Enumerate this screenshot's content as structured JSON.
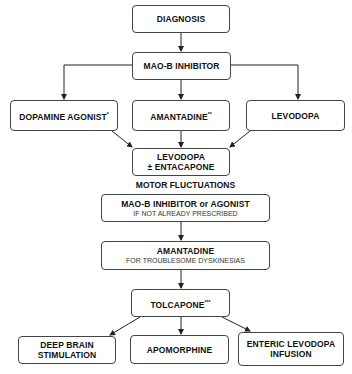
{
  "diagram": {
    "nodes": {
      "diagnosis": {
        "label": "DIAGNOSIS"
      },
      "maob": {
        "label": "MAO-B INHIBITOR"
      },
      "dopamine_agonist": {
        "label": "DOPAMINE AGONIST",
        "mark": "*"
      },
      "amantadine1": {
        "label": "AMANTADINE",
        "mark": "**"
      },
      "levodopa": {
        "label": "LEVODOPA"
      },
      "levodopa_entacapone": {
        "line1": "LEVODOPA",
        "line2": "± ENTACAPONE"
      },
      "maob_or_agonist": {
        "label": "MAO-B INHIBITOR or AGONIST",
        "sub": "IF NOT ALREADY PRESCRIBED"
      },
      "amantadine2": {
        "label": "AMANTADINE",
        "sub": "FOR TROUBLESOME DYSKINESIAS"
      },
      "tolcapone": {
        "label": "TOLCAPONE",
        "mark": "***"
      },
      "dbs": {
        "line1": "DEEP BRAIN",
        "line2": "STIMULATION"
      },
      "apomorphine": {
        "label": "APOMORPHINE"
      },
      "enteric": {
        "line1": "ENTERIC LEVODOPA",
        "line2": "INFUSION"
      }
    },
    "section_label": "MOTOR FLUCTUATIONS"
  }
}
